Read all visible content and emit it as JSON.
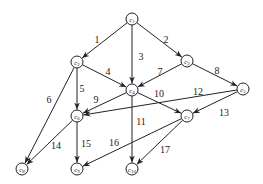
{
  "diagram": {
    "type": "directed-graph",
    "node_radius": 6,
    "nodes": [
      {
        "id": "c1",
        "label": "c1",
        "x": 132,
        "y": 19
      },
      {
        "id": "c2",
        "label": "c2",
        "x": 77,
        "y": 62
      },
      {
        "id": "c3",
        "label": "c3",
        "x": 187,
        "y": 61
      },
      {
        "id": "c4",
        "label": "c4",
        "x": 132,
        "y": 90
      },
      {
        "id": "c5",
        "label": "c5",
        "x": 243,
        "y": 89
      },
      {
        "id": "c6",
        "label": "c6",
        "x": 77,
        "y": 116
      },
      {
        "id": "c7",
        "label": "c7",
        "x": 187,
        "y": 116
      },
      {
        "id": "c8",
        "label": "c8",
        "x": 22,
        "y": 169
      },
      {
        "id": "c9",
        "label": "c9",
        "x": 77,
        "y": 169
      },
      {
        "id": "c10",
        "label": "c10",
        "x": 132,
        "y": 169
      }
    ],
    "edges": [
      {
        "label": "1",
        "from": "c1",
        "to": "c2",
        "lx": 97,
        "ly": 43
      },
      {
        "label": "2",
        "from": "c1",
        "to": "c3",
        "lx": 166,
        "ly": 43
      },
      {
        "label": "3",
        "from": "c1",
        "to": "c4",
        "lx": 141,
        "ly": 60
      },
      {
        "label": "4",
        "from": "c2",
        "to": "c4",
        "lx": 108,
        "ly": 75
      },
      {
        "label": "5",
        "from": "c2",
        "to": "c6",
        "lx": 82,
        "ly": 92
      },
      {
        "label": "6",
        "from": "c2",
        "to": "c8",
        "lx": 49,
        "ly": 103
      },
      {
        "label": "7",
        "from": "c3",
        "to": "c4",
        "lx": 160,
        "ly": 75
      },
      {
        "label": "8",
        "from": "c3",
        "to": "c5",
        "lx": 217,
        "ly": 74
      },
      {
        "label": "9",
        "from": "c4",
        "to": "c6",
        "lx": 96,
        "ly": 103
      },
      {
        "label": "10",
        "from": "c4",
        "to": "c7",
        "lx": 159,
        "ly": 97
      },
      {
        "label": "11",
        "from": "c4",
        "to": "c10",
        "lx": 141,
        "ly": 125
      },
      {
        "label": "12",
        "from": "c5",
        "to": "c6",
        "lx": 198,
        "ly": 95
      },
      {
        "label": "13",
        "from": "c5",
        "to": "c7",
        "lx": 224,
        "ly": 116
      },
      {
        "label": "14",
        "from": "c6",
        "to": "c8",
        "lx": 56,
        "ly": 149
      },
      {
        "label": "15",
        "from": "c6",
        "to": "c9",
        "lx": 86,
        "ly": 147
      },
      {
        "label": "16",
        "from": "c7",
        "to": "c9",
        "lx": 114,
        "ly": 146
      },
      {
        "label": "17",
        "from": "c7",
        "to": "c10",
        "lx": 165,
        "ly": 153
      }
    ]
  }
}
